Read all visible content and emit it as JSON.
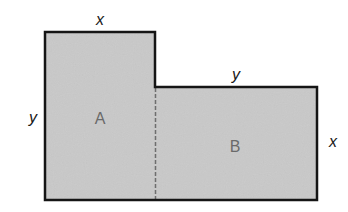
{
  "diagram": {
    "colors": {
      "fill": "#c9c9c9",
      "outline": "#151515",
      "divider": "#6e6e6e",
      "region_label": "#6a6a6a",
      "dimension_label": "#1a1a1a"
    },
    "regions": [
      {
        "id": "A",
        "label": "A"
      },
      {
        "id": "B",
        "label": "B"
      }
    ],
    "dimensions": {
      "top_a": "x",
      "left_a": "y",
      "top_b": "y",
      "right_b": "x"
    }
  }
}
